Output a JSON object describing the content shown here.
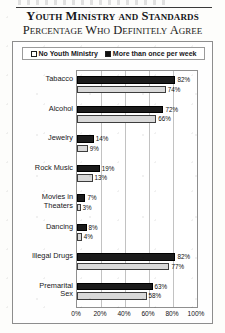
{
  "document": {
    "title": "Youth Ministry and Standards",
    "subtitle": "Percentage Who Definitely Agree"
  },
  "legend": {
    "items": [
      {
        "label": "No Youth Ministry",
        "swatch": "open-square-icon",
        "color": "#ffffff"
      },
      {
        "label": "More than once per week",
        "swatch": "filled-square-icon",
        "color": "#111111"
      }
    ]
  },
  "chart_data": {
    "type": "bar",
    "orientation": "horizontal",
    "title": "Youth Ministry and Standards",
    "subtitle": "Percentage Who Definitely Agree",
    "xlabel": "",
    "ylabel": "",
    "xlim": [
      0,
      100
    ],
    "xticks": [
      "0%",
      "20%",
      "40%",
      "60%",
      "80%",
      "100%"
    ],
    "xtick_values": [
      0,
      20,
      40,
      60,
      80,
      100
    ],
    "grid": true,
    "legend_position": "top",
    "categories": [
      "Tabacco",
      "Alcohol",
      "Jewelry",
      "Rock Music",
      "Movies in Theaters",
      "Dancing",
      "Illegal Drugs",
      "Premarital Sex"
    ],
    "series": [
      {
        "name": "More than once per week",
        "color": "#1b1b1b",
        "values": [
          82,
          72,
          14,
          19,
          7,
          8,
          82,
          63
        ],
        "labels": [
          "82%",
          "72%",
          "14%",
          "19%",
          "7%",
          "8%",
          "82%",
          "63%"
        ]
      },
      {
        "name": "No Youth Ministry",
        "color": "#d9d9d9",
        "values": [
          74,
          66,
          9,
          13,
          3,
          4,
          77,
          58
        ],
        "labels": [
          "74%",
          "66%",
          "9%",
          "13%",
          "3%",
          "4%",
          "77%",
          "58%"
        ]
      }
    ]
  }
}
